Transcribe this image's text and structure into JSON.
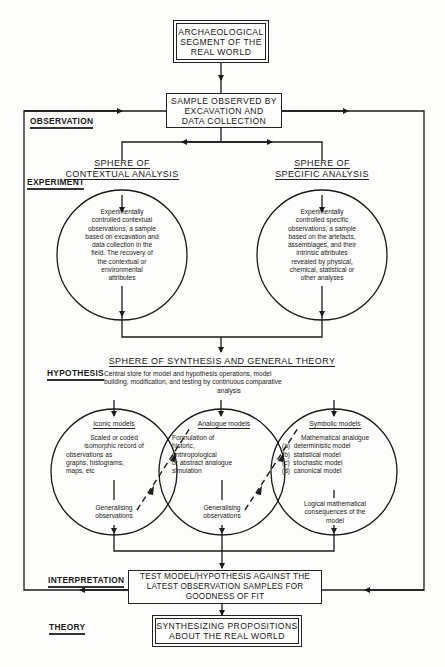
{
  "nodes": {
    "real_world": [
      "ARCHAEOLOGICAL",
      "SEGMENT OF THE",
      "REAL WORLD"
    ],
    "sample": [
      "SAMPLE OBSERVED BY",
      "EXCAVATION AND",
      "DATA COLLECTION"
    ],
    "test": [
      "TEST MODEL/HYPOTHESIS AGAINST THE",
      "LATEST OBSERVATION SAMPLES FOR",
      "GOODNESS OF FIT"
    ],
    "theory_box": [
      "SYNTHESIZING PROPOSITIONS",
      "ABOUT THE REAL WORLD"
    ]
  },
  "stage_labels": {
    "observation": "OBSERVATION",
    "experiment": "EXPERIMENT",
    "hypothesis": "HYPOTHESIS",
    "interpretation": "INTERPRETATION",
    "theory": "THEORY"
  },
  "spheres": {
    "contextual": {
      "heading": [
        "SPHERE OF",
        "CONTEXTUAL ANALYSIS"
      ],
      "body": [
        "Experimentally",
        "controlled contextual",
        "observations, a sample",
        "based on excavation and",
        "data collection in the",
        "field. The recovery of",
        "the contextual or",
        "environmental",
        "attributes"
      ]
    },
    "specific": {
      "heading": [
        "SPHERE OF",
        "SPECIFIC ANALYSIS"
      ],
      "body": [
        "Experimentally",
        "controlled specific",
        "observations, a sample",
        "based on the artefacts,",
        "assemblages, and their",
        "intrinsic attributes",
        "revealed by physical,",
        "chemical, statistical or",
        "other analyses"
      ]
    },
    "synthesis": {
      "heading": "SPHERE OF SYNTHESIS AND GENERAL THEORY",
      "body": [
        "Central store for model and hypothesis operations, model",
        "building, modification, and testing by continuous comparative",
        "analysis"
      ]
    }
  },
  "models": {
    "iconic": {
      "title": "Iconic models",
      "body": [
        "Scaled or coded",
        "isomorphic record of",
        "observations as",
        "graphs, histograms,",
        "maps, etc"
      ],
      "footer": [
        "Generalising",
        "observations"
      ]
    },
    "analogue": {
      "title": "Analogue models",
      "body": [
        "Formulation of",
        "historic,",
        "anthropological",
        "or abstract analogue",
        "simulation"
      ],
      "footer": [
        "Generalising",
        "observations"
      ]
    },
    "symbolic": {
      "title": "Symbolic models",
      "body": [
        "Mathematical analogue",
        "(a)  deterministic model",
        "(b)  statistical model",
        "(c)  stochastic model",
        "(d)  canonical model"
      ],
      "footer": [
        "Logical mathematical",
        "consequences of the",
        "model"
      ]
    }
  }
}
